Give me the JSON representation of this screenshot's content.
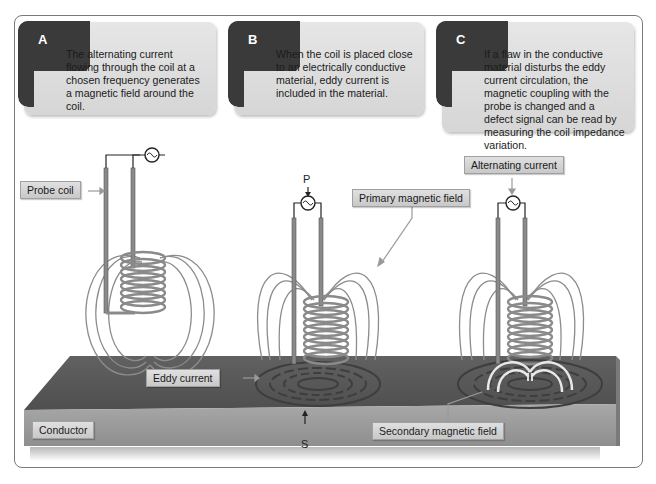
{
  "panels": [
    {
      "letter": "A",
      "text": "The alternating current flowing through the coil at a chosen frequency generates a magnetic field around the coil."
    },
    {
      "letter": "B",
      "text": "When the coil is placed close to an electrically conductive material, eddy current is included in the material."
    },
    {
      "letter": "C",
      "text": "If a flaw in the conductive material disturbs the eddy current circulation, the magnetic coupling with the probe is changed and a defect signal can be read by measuring the coil impedance variation."
    }
  ],
  "labels": {
    "probe_coil": "Probe coil",
    "primary_field": "Primary magnetic field",
    "alternating_current": "Alternating current",
    "eddy_current": "Eddy current",
    "conductor": "Conductor",
    "secondary_field": "Secondary magnetic field"
  },
  "markers": {
    "p": "P",
    "s": "S"
  },
  "colors": {
    "tab": "#3a3a3a",
    "card": "#dddddd",
    "conductor_top": "#5a5a5a",
    "conductor_side": "#9a9a9a",
    "coil": "#8a8a8a",
    "field_line": "#8c8c8c"
  }
}
